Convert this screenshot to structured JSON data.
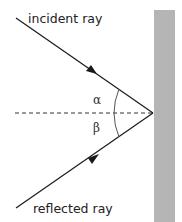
{
  "diagram": {
    "labels": {
      "incident": "incident ray",
      "reflected": "reflected ray",
      "angle_incidence": "α",
      "angle_reflection": "β"
    },
    "colors": {
      "mirror": "#b5b5b5",
      "ray": "#1a1a1a",
      "normal": "#333333",
      "arc": "#555555"
    }
  }
}
